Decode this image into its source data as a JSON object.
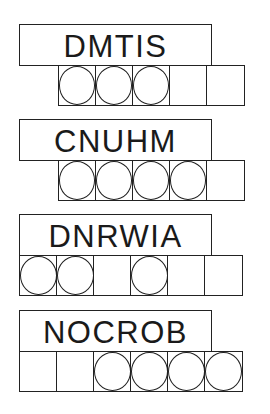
{
  "puzzles": [
    {
      "scrambled": "DMTIS",
      "cell_count": 5,
      "cell_offset": 1,
      "circled": [
        1,
        2,
        3
      ]
    },
    {
      "scrambled": "CNUHM",
      "cell_count": 5,
      "cell_offset": 1,
      "circled": [
        1,
        2,
        3,
        4
      ]
    },
    {
      "scrambled": "DNRWIA",
      "cell_count": 6,
      "cell_offset": 0,
      "circled": [
        1,
        2,
        4
      ]
    },
    {
      "scrambled": "NOCROB",
      "cell_count": 6,
      "cell_offset": 0,
      "circled": [
        3,
        4,
        5,
        6
      ]
    }
  ],
  "colors": {
    "ink": "#222222",
    "background": "#ffffff"
  }
}
